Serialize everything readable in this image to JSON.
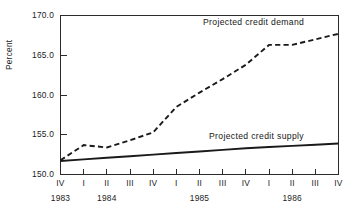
{
  "chart_data": {
    "type": "line",
    "title": "",
    "xlabel": "",
    "ylabel": "Percent",
    "ylim": [
      150.0,
      170.0
    ],
    "ytick_labels": [
      "170.0",
      "165.0",
      "160.0",
      "155.0",
      "150.0"
    ],
    "ytick_values": [
      170.0,
      165.0,
      160.0,
      155.0,
      150.0
    ],
    "grid": false,
    "legend_position": "inline-annotation",
    "x": [
      "IV",
      "I",
      "II",
      "III",
      "IV",
      "I",
      "II",
      "III",
      "IV",
      "I",
      "II",
      "III",
      "IV"
    ],
    "xtick_labels": [
      "IV",
      "I",
      "II",
      "III",
      "IV",
      "I",
      "II",
      "III",
      "IV",
      "I",
      "II",
      "III",
      "IV"
    ],
    "year_groups": [
      {
        "label": "1983",
        "center_index": 0
      },
      {
        "label": "1984",
        "center_index": 2
      },
      {
        "label": "1985",
        "center_index": 6
      },
      {
        "label": "1986",
        "center_index": 10
      }
    ],
    "series": [
      {
        "name": "Projected credit demand",
        "style": "dashed",
        "values": [
          151.8,
          153.7,
          153.4,
          154.3,
          155.3,
          158.5,
          160.3,
          162.0,
          163.8,
          166.3,
          166.3,
          167.0,
          167.7
        ]
      },
      {
        "name": "Projected credit supply",
        "style": "solid",
        "values": [
          151.7,
          151.9,
          152.1,
          152.3,
          152.5,
          152.7,
          152.9,
          153.1,
          153.3,
          153.45,
          153.6,
          153.75,
          153.9
        ]
      }
    ],
    "annotations": [
      {
        "text": "Projected credit demand",
        "target": "demand"
      },
      {
        "text": "Projected credit supply",
        "target": "supply"
      }
    ]
  }
}
